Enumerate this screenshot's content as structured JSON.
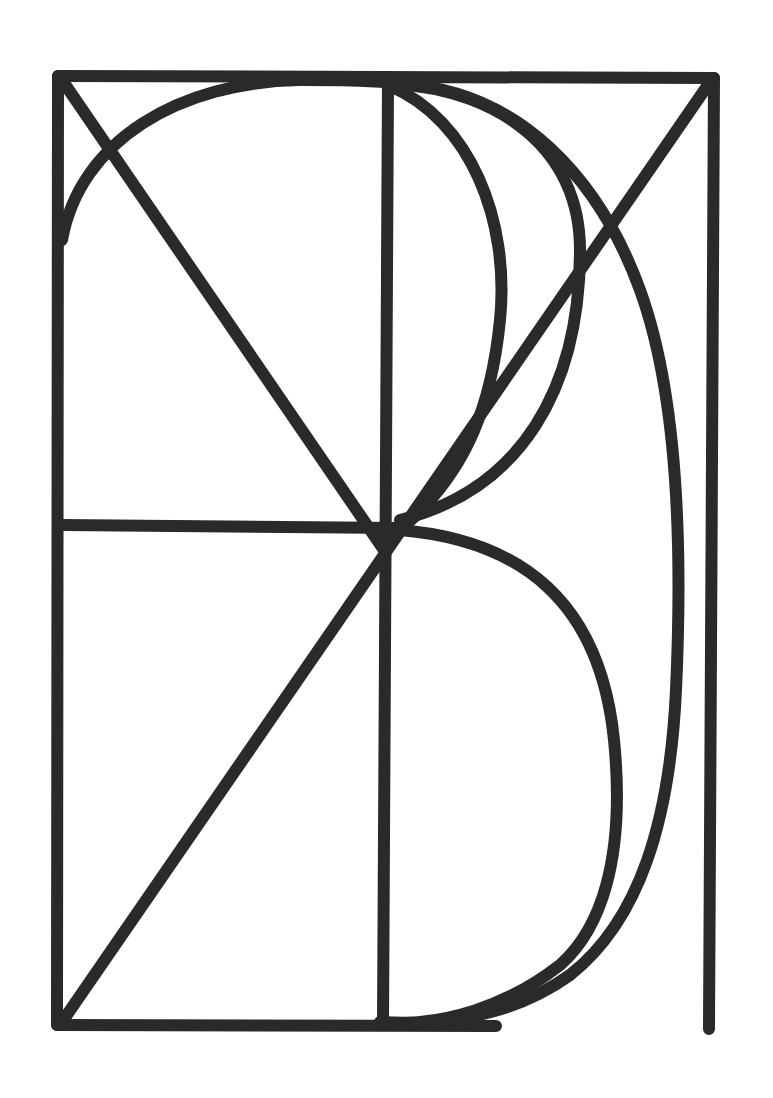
{
  "figure": {
    "title": "",
    "stroke_color": "#2a2a2a",
    "background_color": "#ffffff",
    "elements": [
      {
        "name": "outer-frame-top",
        "type": "line",
        "from": [
          58,
          76
        ],
        "to": [
          714,
          78
        ]
      },
      {
        "name": "outer-frame-left",
        "type": "line",
        "from": [
          58,
          76
        ],
        "to": [
          57,
          1025
        ]
      },
      {
        "name": "outer-frame-right",
        "type": "line",
        "from": [
          714,
          78
        ],
        "to": [
          709,
          1029
        ]
      },
      {
        "name": "outer-frame-bottom",
        "type": "line",
        "from": [
          57,
          1025
        ],
        "to": [
          496,
          1026
        ]
      },
      {
        "name": "diagonal-top-left",
        "type": "line",
        "from": [
          62,
          80
        ],
        "to": [
          384,
          548
        ]
      },
      {
        "name": "diagonal-top-right",
        "type": "line",
        "from": [
          710,
          82
        ],
        "to": [
          62,
          1022
        ]
      },
      {
        "name": "center-vertical",
        "type": "line",
        "from": [
          388,
          82
        ],
        "to": [
          383,
          1024
        ]
      },
      {
        "name": "middle-horizontal",
        "type": "line",
        "from": [
          62,
          525
        ],
        "to": [
          400,
          528
        ]
      },
      {
        "name": "upper-left-arc",
        "type": "arc"
      },
      {
        "name": "upper-bowl-inner",
        "type": "curve"
      },
      {
        "name": "upper-bowl-outer",
        "type": "curve"
      },
      {
        "name": "lower-bowl",
        "type": "curve"
      },
      {
        "name": "large-d-curve",
        "type": "curve"
      }
    ]
  }
}
